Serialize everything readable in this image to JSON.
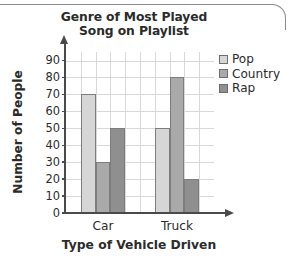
{
  "chart_data": {
    "type": "bar",
    "title": "Genre of Most Played Song on Playlist",
    "title_line1": "Genre of Most Played",
    "title_line2": "Song on Playlist",
    "xlabel": "Type of Vehicle Driven",
    "ylabel": "Number of People",
    "categories": [
      "Car",
      "Truck"
    ],
    "series": [
      {
        "name": "Pop",
        "values": [
          70,
          50
        ],
        "color": "#d6d6d6"
      },
      {
        "name": "Country",
        "values": [
          30,
          80
        ],
        "color": "#a9a9a9"
      },
      {
        "name": "Rap",
        "values": [
          50,
          20
        ],
        "color": "#8f8f8f"
      }
    ],
    "ylim": [
      0,
      95
    ],
    "yticks": [
      0,
      10,
      20,
      30,
      40,
      50,
      60,
      70,
      80,
      90
    ],
    "ytick_labels": [
      "0",
      "10",
      "20",
      "30",
      "40",
      "50",
      "60",
      "70",
      "80",
      "90"
    ],
    "grid": true,
    "legend_position": "right",
    "axis_arrows": true
  },
  "legend": {
    "entries": [
      {
        "label": "Pop"
      },
      {
        "label": "Country"
      },
      {
        "label": "Rap"
      }
    ]
  },
  "icons": {
    "y_axis_arrow": "arrow-up-icon",
    "x_axis_arrow": "arrow-right-icon"
  }
}
